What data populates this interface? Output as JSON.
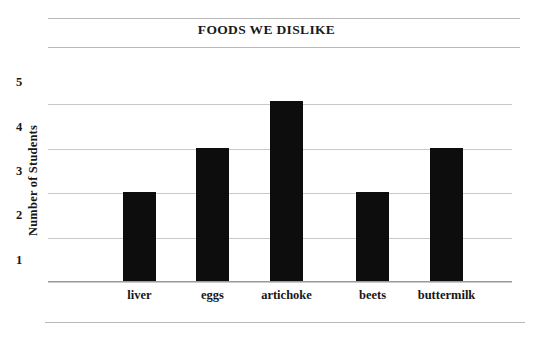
{
  "chart_data": {
    "type": "bar",
    "title": "FOODS WE DISLIKE",
    "xlabel": "",
    "ylabel": "Number of Students",
    "categories": [
      "liver",
      "eggs",
      "artichoke",
      "beets",
      "buttermilk"
    ],
    "values": [
      2.5,
      3.5,
      4.55,
      2.5,
      3.5
    ],
    "ytick_labels": [
      "5",
      "4",
      "3",
      "2",
      "1"
    ],
    "ytick_values": [
      5,
      4,
      3,
      2,
      1
    ],
    "gridline_values": [
      4.5,
      3.5,
      2.5,
      1.5,
      0.5
    ],
    "ylim": [
      0.5,
      5.5
    ],
    "grid": true,
    "legend": false,
    "bar_color": "#0d0d0d",
    "grid_color": "#c9c9c9",
    "background_color": "#ffffff"
  },
  "figure": {
    "title": "FOODS WE DISLIKE",
    "y_axis_title": "Number of Students"
  }
}
